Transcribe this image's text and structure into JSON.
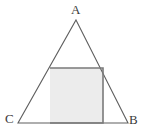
{
  "figure": {
    "name": "square-inscribed-in-triangle",
    "canvas": {
      "width": 146,
      "height": 134,
      "background": "#ffffff"
    },
    "labels": {
      "apex": "A",
      "bottom_left": "C",
      "bottom_right": "B"
    },
    "colors": {
      "triangle_stroke": "#5f5f5f",
      "square_stroke": "#7a7a7a",
      "square_fill": "#ececec",
      "label_text": "#3a3a3a"
    },
    "strokes": {
      "triangle_width": 1.1,
      "square_width": 1.6
    },
    "geometry": {
      "triangle": {
        "type": "triangle",
        "vertices": [
          {
            "label": "A",
            "x": 76,
            "y": 20
          },
          {
            "label": "B",
            "x": 128,
            "y": 123
          },
          {
            "label": "C",
            "x": 18,
            "y": 123
          }
        ],
        "points_attr": "76,20 128,123 18,123"
      },
      "square": {
        "type": "square",
        "x": 50,
        "y": 68,
        "width": 53,
        "height": 55,
        "corners": [
          {
            "x": 50,
            "y": 68
          },
          {
            "x": 103,
            "y": 68
          },
          {
            "x": 103,
            "y": 123
          },
          {
            "x": 50,
            "y": 123
          }
        ],
        "points_attr": "50,68 103,68 103,123 50,123"
      }
    }
  }
}
